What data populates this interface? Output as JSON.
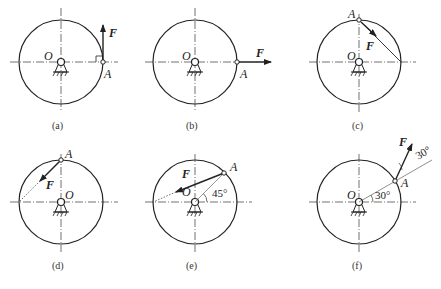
{
  "figure": {
    "panels": [
      {
        "id": "a",
        "caption": "(a)",
        "center_label": "O",
        "point_label": "A",
        "force_label": "F",
        "description": "Force F vertical upward at A on right end of horizontal diameter, right-angle mark"
      },
      {
        "id": "b",
        "caption": "(b)",
        "center_label": "O",
        "point_label": "A",
        "force_label": "F",
        "description": "Force F horizontal to the right at A on right end of horizontal diameter"
      },
      {
        "id": "c",
        "caption": "(c)",
        "center_label": "O",
        "point_label": "A",
        "force_label": "F",
        "description": "Force F along chord from top point A toward right end of horizontal diameter"
      },
      {
        "id": "d",
        "caption": "(d)",
        "center_label": "O",
        "point_label": "A",
        "force_label": "F",
        "description": "Force F along chord from top point A toward left end of horizontal diameter"
      },
      {
        "id": "e",
        "caption": "(e)",
        "center_label": "O",
        "point_label": "A",
        "force_label": "F",
        "angle_label": "45°",
        "description": "A at 45°, force F directed toward left end of horizontal diameter"
      },
      {
        "id": "f",
        "caption": "(f)",
        "center_label": "O",
        "point_label": "A",
        "force_label": "F",
        "angle_label_1": "30°",
        "angle_label_2": "30°",
        "description": "A at 30°, force F at 30° to the radial line OA"
      }
    ]
  },
  "colors": {
    "line": "#222222",
    "background": "#ffffff"
  }
}
